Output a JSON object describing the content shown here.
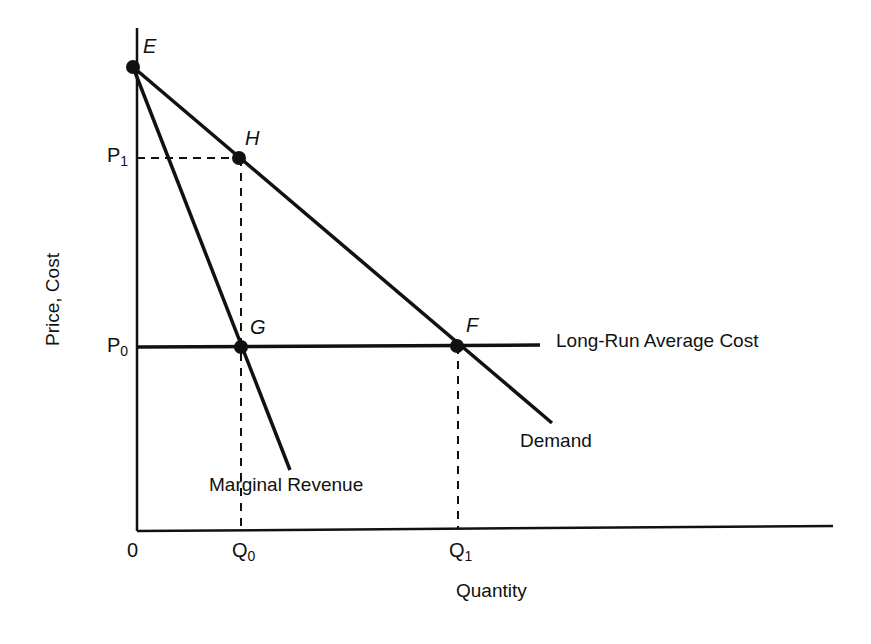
{
  "diagram": {
    "type": "monopoly-pricing",
    "axes": {
      "x_label": "Quantity",
      "y_label": "Price, Cost",
      "origin_label": "0"
    },
    "ticks": {
      "x": [
        {
          "base": "Q",
          "sub": "0"
        },
        {
          "base": "Q",
          "sub": "1"
        }
      ],
      "y": [
        {
          "base": "P",
          "sub": "1"
        },
        {
          "base": "P",
          "sub": "0"
        }
      ]
    },
    "points": [
      {
        "label": "E"
      },
      {
        "label": "H"
      },
      {
        "label": "G"
      },
      {
        "label": "F"
      }
    ],
    "curves": {
      "demand": "Demand",
      "marginal_revenue": "Marginal Revenue",
      "lrac": "Long-Run Average Cost"
    },
    "colors": {
      "ink": "#111111",
      "background": "#ffffff"
    }
  }
}
